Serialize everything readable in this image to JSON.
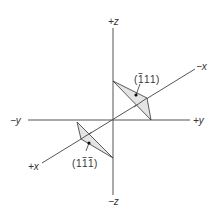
{
  "diagram": {
    "type": "crystallographic-planes-axes",
    "axes": {
      "plus_z": "+z",
      "minus_z": "−z",
      "plus_y": "+y",
      "minus_y": "−y",
      "plus_x": "+x",
      "minus_x": "−x"
    },
    "planes": [
      {
        "id": "upper",
        "miller_digits": [
          "1",
          "1",
          "1"
        ],
        "overbars": [
          true,
          false,
          false
        ],
        "label_text": "(1̄11)",
        "fill_color": "#e4e4e4"
      },
      {
        "id": "lower",
        "miller_digits": [
          "1",
          "1",
          "1"
        ],
        "overbars": [
          false,
          true,
          true
        ],
        "label_text": "(11̄1̄)",
        "fill_color": "#e4e4e4"
      }
    ],
    "colors": {
      "axis": "#555555",
      "outline": "#333333",
      "plane_fill": "#e4e4e4"
    }
  }
}
